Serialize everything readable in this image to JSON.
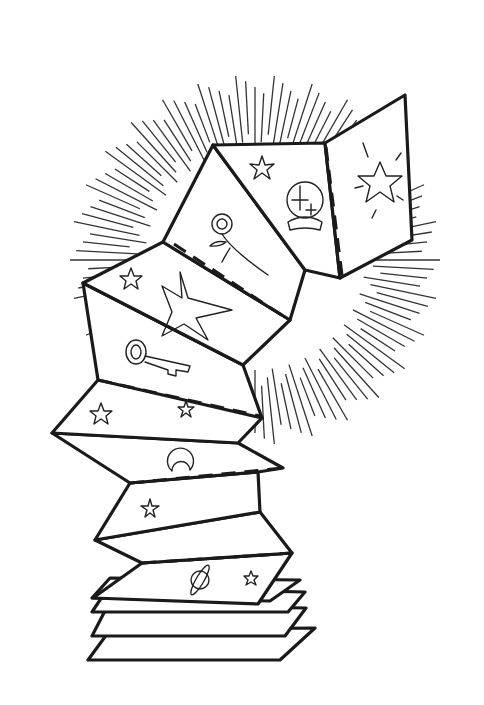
{
  "illustration": {
    "title": "Folded accordion paper with mystical symbols",
    "style": "black line art coloring page",
    "colors": {
      "line": "#1a1a1a",
      "background": "#ffffff"
    },
    "symbols": [
      "star",
      "crystal-ball",
      "sparkle-star",
      "rose",
      "large-star",
      "key",
      "crescent-moon",
      "planet"
    ],
    "background_element": "radiating sunburst lines"
  }
}
